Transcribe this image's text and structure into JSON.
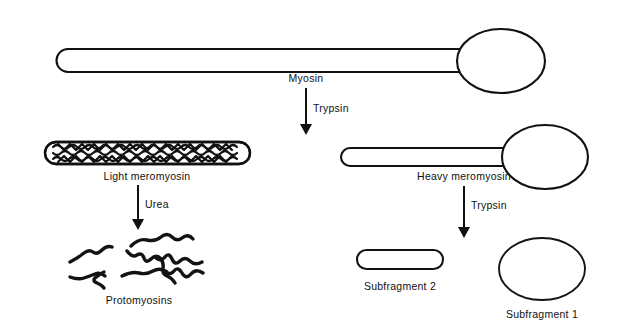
{
  "figure": {
    "background_color": "#ffffff",
    "ink_color": "#111111",
    "title_caption": "",
    "nodes": {
      "myosin": {
        "label": "Myosin",
        "shape": "rod-with-oval-head",
        "label_x": 306,
        "label_y": 82
      },
      "light_meromyosin": {
        "label": "Light meromyosin",
        "shape": "filled-capsule",
        "label_x": 147,
        "label_y": 180
      },
      "heavy_meromyosin": {
        "label": "Heavy meromyosin",
        "shape": "rod-with-oval-head",
        "label_x": 464,
        "label_y": 180
      },
      "protomyosins": {
        "label": "Protomyosins",
        "shape": "scattered-strands",
        "label_x": 139,
        "label_y": 304
      },
      "subfragment_2": {
        "label": "Subfragment 2",
        "shape": "capsule",
        "label_x": 400,
        "label_y": 290
      },
      "subfragment_1": {
        "label": "Subfragment 1",
        "shape": "ellipse",
        "label_x": 542,
        "label_y": 318
      }
    },
    "arrows": [
      {
        "name": "myosin-cleavage",
        "label": "Trypsin",
        "label_x": 313,
        "label_y": 112,
        "x": 306,
        "y_start": 88,
        "y_end": 133
      },
      {
        "name": "lmm-denaturation",
        "label": "Urea",
        "label_x": 145,
        "label_y": 208,
        "x": 138,
        "y_start": 185,
        "y_end": 228
      },
      {
        "name": "hmm-cleavage",
        "label": "Trypsin",
        "label_x": 471,
        "label_y": 209,
        "x": 464,
        "y_start": 186,
        "y_end": 237
      }
    ]
  }
}
